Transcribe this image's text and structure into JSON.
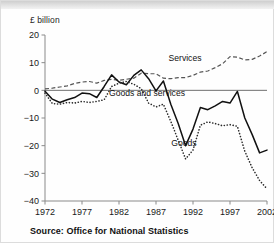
{
  "figure": {
    "y_axis_title": "£ billion",
    "source_note": "Source: Office for National Statistics"
  },
  "labels": {
    "services": "Services",
    "goods_and_services": "Goods and services",
    "goods": "Goods"
  },
  "chart_data": {
    "type": "line",
    "title": "",
    "xlabel": "",
    "ylabel": "£ billion",
    "xlim": [
      1972,
      2002
    ],
    "ylim": [
      -40,
      20
    ],
    "yticks": [
      20,
      10,
      0,
      -10,
      -20,
      -30,
      -40
    ],
    "ytick_labels": [
      "20",
      "10",
      "0",
      "-10",
      "-20",
      "-30",
      "-40"
    ],
    "xticks": [
      1972,
      1977,
      1982,
      1987,
      1992,
      1997,
      2002
    ],
    "xtick_labels": [
      "1972",
      "1977",
      "1982",
      "1987",
      "1992",
      "1997",
      "2002"
    ],
    "grid": false,
    "legend_position": "inline-annotations",
    "x": [
      1972,
      1973,
      1974,
      1975,
      1976,
      1977,
      1978,
      1979,
      1980,
      1981,
      1982,
      1983,
      1984,
      1985,
      1986,
      1987,
      1988,
      1989,
      1990,
      1991,
      1992,
      1993,
      1994,
      1995,
      1996,
      1997,
      1998,
      1999,
      2000,
      2001,
      2002
    ],
    "series": [
      {
        "name": "Services",
        "style": "dashed",
        "color": "#555555",
        "values": [
          0.5,
          0.8,
          1.2,
          1.6,
          2.5,
          3.0,
          3.2,
          2.6,
          3.6,
          4.0,
          3.6,
          4.0,
          4.4,
          6.2,
          6.0,
          6.0,
          4.4,
          4.2,
          4.6,
          4.6,
          5.4,
          6.6,
          7.0,
          8.2,
          9.6,
          12.2,
          12.0,
          11.0,
          11.2,
          12.4,
          14.0
        ]
      },
      {
        "name": "Goods and services",
        "style": "solid",
        "color": "#111111",
        "values": [
          -0.3,
          -3.2,
          -4.4,
          -3.4,
          -2.6,
          -1.0,
          -1.2,
          -2.6,
          1.4,
          5.6,
          3.0,
          2.0,
          5.4,
          7.4,
          4.2,
          -0.2,
          3.4,
          -5.0,
          -12.0,
          -20.0,
          -14.0,
          -6.2,
          -7.0,
          -5.6,
          -4.0,
          -4.6,
          -0.4,
          -10.0,
          -16.0,
          -22.6,
          -21.6
        ]
      },
      {
        "name": "Goods",
        "style": "dotted",
        "color": "#2a2a2a",
        "values": [
          -1.0,
          -4.8,
          -5.0,
          -4.4,
          -4.6,
          -4.0,
          -4.4,
          -4.0,
          -3.4,
          1.4,
          2.6,
          3.2,
          2.2,
          0.6,
          -4.6,
          -6.0,
          -5.0,
          -11.2,
          -18.0,
          -24.8,
          -21.6,
          -12.6,
          -11.4,
          -12.0,
          -12.8,
          -12.4,
          -13.0,
          -22.0,
          -28.0,
          -32.6,
          -35.6
        ]
      }
    ]
  }
}
